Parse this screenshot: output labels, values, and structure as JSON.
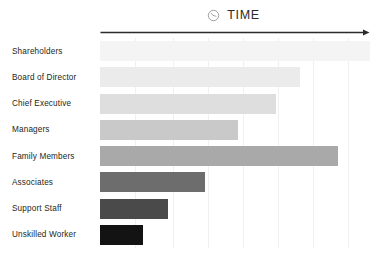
{
  "chart_data": {
    "type": "bar",
    "orientation": "horizontal",
    "title": "TIME",
    "xlabel": "TIME",
    "ylabel": "",
    "categories": [
      "Shareholders",
      "Board of Director",
      "Chief Executive",
      "Managers",
      "Family Members",
      "Associates",
      "Support Staff",
      "Unskilled Worker"
    ],
    "values": [
      100,
      74,
      65,
      51,
      88,
      39,
      25,
      16
    ],
    "xlim": [
      0,
      100
    ],
    "grid": true,
    "gridline_positions": [
      13,
      27,
      40,
      53,
      66,
      79,
      92
    ],
    "legend": "none",
    "bar_colors": [
      "#f4f4f4",
      "#ebebeb",
      "#dedede",
      "#c9c9c9",
      "#a9a9a9",
      "#6d6d6d",
      "#4a4a4a",
      "#131313"
    ],
    "axis_color": "#2b2b2b",
    "grid_color": "#f0f0f0",
    "background": "#ffffff",
    "annotations": [
      {
        "name": "time-arrow",
        "text": "",
        "description": "horizontal arrow pointing right spanning the plot width"
      }
    ]
  },
  "header": {
    "icon": "clock-icon",
    "label": "TIME"
  }
}
